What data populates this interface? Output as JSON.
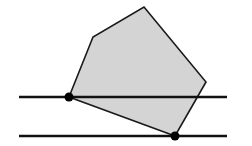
{
  "diagram": {
    "width": 252,
    "height": 146,
    "background": "#ffffff",
    "polygon": {
      "fill": "#d4d4d4",
      "stroke": "#1a1a1a",
      "stroke_width": 1.6,
      "points": [
        [
          69,
          97
        ],
        [
          93,
          37
        ],
        [
          144,
          7
        ],
        [
          206,
          82
        ],
        [
          175,
          136
        ]
      ]
    },
    "lines": [
      {
        "name": "upper-parallel-line",
        "x1": 19,
        "y1": 97,
        "x2": 227,
        "y2": 97
      },
      {
        "name": "lower-parallel-line",
        "x1": 19,
        "y1": 136,
        "x2": 227,
        "y2": 136
      }
    ],
    "line_style": {
      "stroke": "#111111",
      "stroke_width": 2.6
    },
    "points": [
      {
        "name": "contact-point-upper",
        "cx": 69,
        "cy": 97,
        "r": 4.5
      },
      {
        "name": "contact-point-lower",
        "cx": 175,
        "cy": 136,
        "r": 4.5
      }
    ],
    "point_color": "#000000"
  }
}
